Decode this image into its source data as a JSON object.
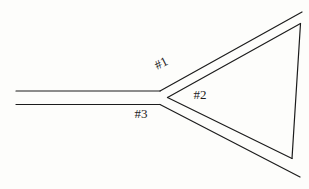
{
  "figure": {
    "background_color": "#fdfdfb",
    "line_color": "#1c1c1c",
    "line_width": 1.2,
    "labels": [
      {
        "name": "branch-label-1",
        "text": "#1",
        "x": 163,
        "y": 67,
        "rotation": -27
      },
      {
        "name": "branch-label-2",
        "text": "#2",
        "x": 200,
        "y": 99,
        "rotation": 0
      },
      {
        "name": "branch-label-3",
        "text": "#3",
        "x": 141,
        "y": 118,
        "rotation": 0
      }
    ],
    "segments": [
      {
        "name": "feed-line-upper",
        "x1": 16,
        "y1": 91,
        "x2": 160,
        "y2": 91
      },
      {
        "name": "feed-line-lower",
        "x1": 16,
        "y1": 104.5,
        "x2": 160,
        "y2": 104.5
      },
      {
        "name": "upper-branch-outer-line",
        "x1": 160,
        "y1": 91,
        "x2": 302,
        "y2": 12
      },
      {
        "name": "lower-branch-outer-line",
        "x1": 160,
        "y1": 104.5,
        "x2": 300,
        "y2": 177
      },
      {
        "name": "upper-branch-inner-line",
        "x1": 167.5,
        "y1": 97.5,
        "x2": 300.5,
        "y2": 23.5
      },
      {
        "name": "lower-branch-inner-line",
        "x1": 167.5,
        "y1": 97.5,
        "x2": 292,
        "y2": 158.5
      },
      {
        "name": "right-side-line",
        "x1": 300.5,
        "y1": 23.5,
        "x2": 292,
        "y2": 158.5
      }
    ]
  }
}
